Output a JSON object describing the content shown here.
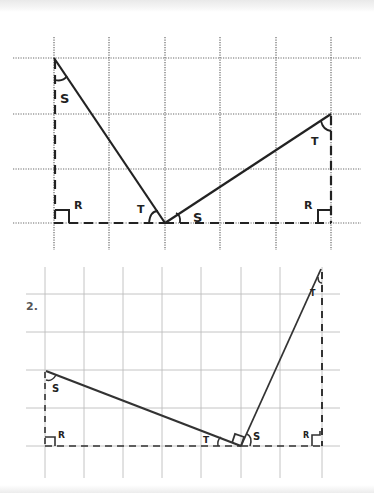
{
  "worksheet": {
    "colors": {
      "ink": "#222222",
      "grid_dotted": "#6a6a6a",
      "grid_light": "#bdbdbd",
      "label": "#555555"
    },
    "figure1": {
      "grid": {
        "style": "dotted",
        "vertical_x": [
          54,
          109,
          165,
          220,
          276,
          331
        ],
        "horizontal_y": [
          58,
          114,
          169,
          223
        ],
        "x_extent": [
          13,
          361
        ],
        "y_extent": [
          37,
          250
        ]
      },
      "left_triangle": {
        "top_vertex": [
          54,
          58
        ],
        "right_angle_vertex": [
          54,
          223
        ],
        "base_vertex": [
          165,
          223
        ],
        "angle_labels": {
          "top": "S",
          "right_angle": "R",
          "base": "T"
        }
      },
      "right_triangle": {
        "base_vertex": [
          165,
          223
        ],
        "top_vertex": [
          331,
          114
        ],
        "right_angle_vertex": [
          331,
          223
        ],
        "angle_labels": {
          "base": "S",
          "top": "T",
          "right_angle": "R"
        }
      }
    },
    "figure2": {
      "number_label": "2.",
      "grid": {
        "style": "light",
        "vertical_x": [
          45,
          84,
          123,
          162,
          201,
          241,
          280,
          322
        ],
        "horizontal_y": [
          294,
          332,
          370,
          408,
          446
        ],
        "x_extent": [
          26,
          340
        ],
        "y_extent": [
          267,
          478
        ]
      },
      "left_triangle": {
        "top_vertex": [
          45,
          370
        ],
        "right_angle_vertex": [
          45,
          446
        ],
        "base_vertex": [
          241,
          446
        ],
        "angle_labels": {
          "top": "S",
          "right_angle": "R",
          "base": "T"
        }
      },
      "right_triangle": {
        "base_vertex": [
          241,
          446
        ],
        "top_vertex": [
          322,
          268
        ],
        "right_angle_vertex": [
          322,
          446
        ],
        "angle_labels": {
          "base": "S",
          "top": "T",
          "right_angle": "R"
        }
      },
      "right_angle_between_segments": true
    }
  }
}
